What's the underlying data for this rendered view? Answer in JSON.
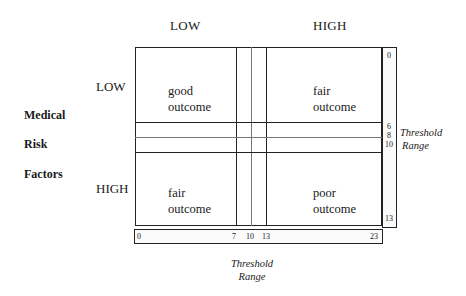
{
  "diagram": {
    "column_headers": {
      "low": "LOW",
      "high": "HIGH"
    },
    "row_headers": {
      "low": "LOW",
      "high": "HIGH"
    },
    "row_axis_title": {
      "line1": "Medical",
      "line2": "Risk",
      "line3": "Factors"
    },
    "cells": {
      "top_left": {
        "line1": "good",
        "line2": "outcome"
      },
      "top_right": {
        "line1": "fair",
        "line2": "outcome"
      },
      "bottom_left": {
        "line1": "fair",
        "line2": "outcome"
      },
      "bottom_right": {
        "line1": "poor",
        "line2": "outcome"
      }
    },
    "horizontal_scale": {
      "ticks": [
        "0",
        "7",
        "10",
        "13",
        "23"
      ],
      "label_line1": "Threshold",
      "label_line2": "Range"
    },
    "vertical_scale": {
      "ticks": [
        "0",
        "6",
        "8",
        "10",
        "13"
      ],
      "label_line1": "Threshold",
      "label_line2": "Range"
    },
    "colors": {
      "line": "#222222",
      "background": "#ffffff",
      "text": "#1a1a1a"
    }
  }
}
